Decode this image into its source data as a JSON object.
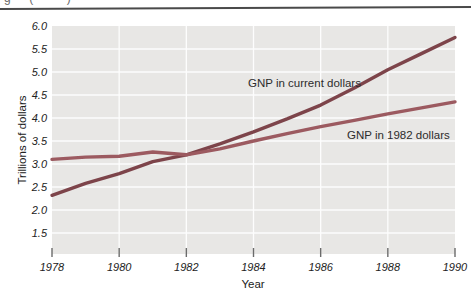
{
  "figure": {
    "clipped_caption": "g  (    )",
    "top_rule_color": "#4a4a4a",
    "plot_background": "#e8e7e5",
    "gridline_color": "#fdfdfd",
    "tick_color": "#6b6b6b",
    "text_color": "#222222"
  },
  "chart_data": {
    "type": "line",
    "title": "",
    "xlabel": "Year",
    "ylabel": "Trillions of dollars",
    "x": [
      1978,
      1979,
      1980,
      1981,
      1982,
      1983,
      1984,
      1985,
      1986,
      1987,
      1988,
      1989,
      1990
    ],
    "series": [
      {
        "name": "GNP in current dollars",
        "color": "#7d444a",
        "values": [
          2.32,
          2.58,
          2.79,
          3.05,
          3.2,
          3.44,
          3.7,
          3.98,
          4.28,
          4.65,
          5.05,
          5.4,
          5.75
        ]
      },
      {
        "name": "GNP in 1982 dollars",
        "color": "#9c5a60",
        "values": [
          3.1,
          3.15,
          3.17,
          3.26,
          3.2,
          3.33,
          3.5,
          3.66,
          3.81,
          3.95,
          4.09,
          4.22,
          4.35
        ]
      }
    ],
    "xticks": [
      1978,
      1980,
      1982,
      1984,
      1986,
      1988,
      1990
    ],
    "yticks": [
      "6.0",
      "5.5",
      "5.0",
      "4.5",
      "4.0",
      "3.5",
      "3.0",
      "2.5",
      "2.0",
      "1.5"
    ],
    "xlim": [
      1978,
      1990
    ],
    "ylim": [
      1.04,
      6.0
    ],
    "grid": true,
    "legend_position": "inline-labels"
  }
}
